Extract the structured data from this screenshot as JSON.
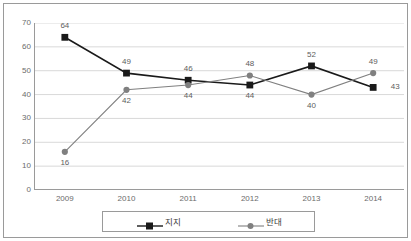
{
  "chart_data": {
    "type": "line",
    "title": "",
    "subtitle": "",
    "xlabel": "",
    "ylabel": "",
    "categories": [
      "2009",
      "2010",
      "2011",
      "2012",
      "2013",
      "2014"
    ],
    "ylim": [
      0,
      70
    ],
    "yticks": [
      0,
      10,
      20,
      30,
      40,
      50,
      60,
      70
    ],
    "ytick_labels": [
      "0",
      "10",
      "20",
      "30",
      "40",
      "50",
      "60",
      "70"
    ],
    "grid": "horizontal",
    "legend_position": "bottom",
    "series": [
      {
        "name": "지지",
        "color": "#1a1a1a",
        "marker": "square",
        "values": [
          64,
          49,
          46,
          44,
          52,
          43
        ],
        "labels": [
          "64",
          "49",
          "46",
          "44",
          "52",
          "43"
        ],
        "label_positions": [
          "above",
          "above",
          "above",
          "below",
          "above",
          "right"
        ]
      },
      {
        "name": "반대",
        "color": "#808080",
        "marker": "circle",
        "values": [
          16,
          42,
          44,
          48,
          40,
          49
        ],
        "labels": [
          "16",
          "42",
          "44",
          "48",
          "40",
          "49"
        ],
        "label_positions": [
          "below",
          "below",
          "below",
          "above",
          "below",
          "above"
        ]
      }
    ]
  },
  "legend": {
    "items": [
      {
        "label": "지지",
        "marker": "square",
        "color": "#1a1a1a"
      },
      {
        "label": "반대",
        "marker": "circle",
        "color": "#808080"
      }
    ]
  },
  "colors": {
    "support": "#1a1a1a",
    "oppose": "#808080",
    "gridline": "#d9d9d9",
    "axis": "#9a9a9a",
    "tick_text": "#6b6b6b",
    "label_text": "#5d5d5d",
    "background": "#ffffff"
  }
}
